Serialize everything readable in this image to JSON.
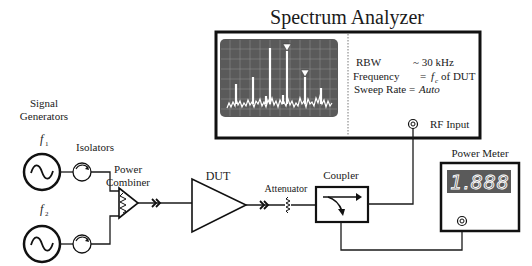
{
  "title": "Spectrum Analyzer",
  "spectrum_analyzer": {
    "title": "Spectrum Analyzer",
    "settings": [
      {
        "label": "RBW",
        "value": "~ 30 kHz"
      },
      {
        "label": "Frequency",
        "value": "= f_c of DUT"
      },
      {
        "label": "Sweep Rate",
        "value": "= Auto"
      }
    ],
    "rbw_label": "RBW",
    "rbw_value": "~ 30 kHz",
    "freq_label": "Frequency",
    "freq_eq": "=",
    "freq_f": "f",
    "freq_sub": "c",
    "freq_tail": "of DUT",
    "sweep_label": "Sweep Rate =",
    "sweep_value": "Auto",
    "rf_input_label": "RF Input",
    "colors": {
      "screen": "#5a5a5a",
      "trace": "#ffffff",
      "grid": "#8a8a8a"
    }
  },
  "signal_generators": {
    "label_line1": "Signal",
    "label_line2": "Generators",
    "gen1": {
      "f": "f",
      "sub": "1"
    },
    "gen2": {
      "f": "f",
      "sub": "2"
    }
  },
  "isolators": {
    "label": "Isolators"
  },
  "power_combiner": {
    "label_line1": "Power",
    "label_line2": "Combiner"
  },
  "dut": {
    "label": "DUT"
  },
  "attenuator": {
    "label": "Attenuator"
  },
  "coupler": {
    "label": "Coupler"
  },
  "power_meter": {
    "label": "Power Meter",
    "reading": "1.888",
    "colors": {
      "display": "#5a5a5a",
      "digits": "#ffffff"
    }
  }
}
